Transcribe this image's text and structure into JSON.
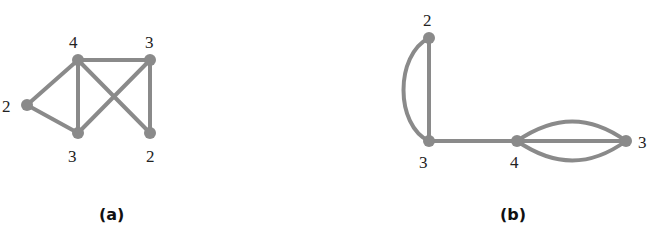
{
  "figure": {
    "colors": {
      "edge": "#8a8a8a",
      "node": "#8a8a8a",
      "text": "#222222"
    },
    "graphs": [
      {
        "caption": "(a)",
        "nodes": [
          {
            "id": "A",
            "degree": "4",
            "x": 78,
            "y": 60
          },
          {
            "id": "B",
            "degree": "3",
            "x": 150,
            "y": 60
          },
          {
            "id": "C",
            "degree": "2",
            "x": 27,
            "y": 105
          },
          {
            "id": "D",
            "degree": "3",
            "x": 78,
            "y": 133
          },
          {
            "id": "E",
            "degree": "2",
            "x": 150,
            "y": 133
          }
        ],
        "edges": [
          [
            "A",
            "B"
          ],
          [
            "A",
            "C"
          ],
          [
            "A",
            "D"
          ],
          [
            "A",
            "E"
          ],
          [
            "B",
            "D"
          ],
          [
            "B",
            "E"
          ],
          [
            "C",
            "D"
          ]
        ]
      },
      {
        "caption": "(b)",
        "nodes": [
          {
            "id": "P",
            "degree": "2",
            "x": 429,
            "y": 38
          },
          {
            "id": "Q",
            "degree": "3",
            "x": 429,
            "y": 141
          },
          {
            "id": "R",
            "degree": "4",
            "x": 517,
            "y": 141
          },
          {
            "id": "S",
            "degree": "3",
            "x": 626,
            "y": 141
          }
        ],
        "edges": [
          [
            "P",
            "Q"
          ],
          [
            "P",
            "Q",
            "curved"
          ],
          [
            "Q",
            "R"
          ],
          [
            "R",
            "S"
          ],
          [
            "R",
            "S",
            "curved-up"
          ],
          [
            "R",
            "S",
            "curved-down"
          ]
        ]
      }
    ]
  }
}
